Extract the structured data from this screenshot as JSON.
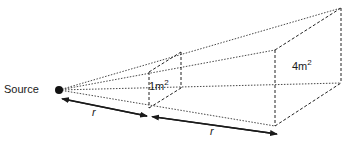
{
  "diagram": {
    "source_label": "Source",
    "near_area": {
      "value": "1m",
      "exponent": "2"
    },
    "far_area": {
      "value": "4m",
      "exponent": "2"
    },
    "distance_1": "r",
    "distance_2": "r",
    "colors": {
      "line": "#1a1a1a",
      "background": "#ffffff"
    }
  }
}
